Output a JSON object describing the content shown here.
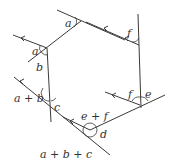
{
  "diagram": {
    "type": "polygon-exterior-angles",
    "labels": {
      "a_top": "a",
      "a_left": "a",
      "b": "b",
      "c": "c",
      "d": "d",
      "e": "e",
      "f_top": "f",
      "f_right": "f",
      "a_plus_b": "a + b",
      "e_plus_f": "e + f",
      "a_plus_b_plus_c": "a + b + c"
    },
    "colors": {
      "stroke": "#3a3a3a",
      "text": "#333333",
      "background": "#ffffff"
    }
  }
}
